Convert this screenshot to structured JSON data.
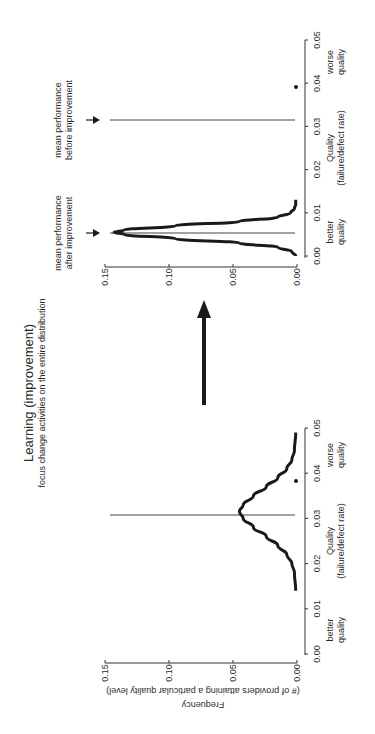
{
  "figure": {
    "title": "Learning (improvement)",
    "subtitle": "focus change activities on the entire distribution",
    "arrow_label": "",
    "colors": {
      "curve": "#1a1a1a",
      "axis": "#333333",
      "mean_line": "#555555",
      "background": "#ffffff"
    }
  },
  "chart_data": [
    {
      "type": "line",
      "name": "before-improvement",
      "title": "",
      "xlabel": "Quality\n(failure/defect rate)",
      "xlabel_line1": "Quality",
      "xlabel_line2": "(failure/defect rate)",
      "ylabel": "Frequency (# of providers attaining a particular quality level)",
      "ylabel_line1": "Frequency",
      "ylabel_line2": "(# of providers attaining a particular quality level)",
      "xlim": [
        0,
        0.05
      ],
      "ylim": [
        0,
        0.15
      ],
      "xticks": [
        "0.00",
        "0.01",
        "0.02",
        "0.03",
        "0.04",
        "0.05"
      ],
      "yticks": [
        "0.00",
        "0.05",
        "0.10",
        "0.15"
      ],
      "x_end_labels": {
        "left": "better\nquality",
        "left_line1": "better",
        "left_line2": "quality",
        "right": "worse\nquality",
        "right_line1": "worse",
        "right_line2": "quality"
      },
      "series": [
        {
          "name": "distribution before improvement",
          "x": [
            0.014,
            0.018,
            0.02,
            0.022,
            0.024,
            0.026,
            0.028,
            0.03,
            0.0315,
            0.033,
            0.035,
            0.037,
            0.039,
            0.041,
            0.043,
            0.045,
            0.049
          ],
          "y": [
            0.001,
            0.002,
            0.004,
            0.008,
            0.015,
            0.024,
            0.034,
            0.042,
            0.045,
            0.042,
            0.034,
            0.024,
            0.015,
            0.008,
            0.004,
            0.002,
            0.001
          ]
        }
      ],
      "mean_line": {
        "x": 0.0315,
        "label": ""
      },
      "outlier_point": {
        "x": 0.039,
        "y": 0.0
      },
      "grid": false
    },
    {
      "type": "line",
      "name": "after-improvement",
      "title": "",
      "xlabel": "Quality\n(failure/defect rate)",
      "xlabel_line1": "Quality",
      "xlabel_line2": "(failure/defect rate)",
      "ylabel": "",
      "xlim": [
        0,
        0.05
      ],
      "ylim": [
        0,
        0.15
      ],
      "xticks": [
        "0.00",
        "0.01",
        "0.02",
        "0.03",
        "0.04",
        "0.05"
      ],
      "yticks": [
        "0.00",
        "0.05",
        "0.10",
        "0.15"
      ],
      "x_end_labels": {
        "left_line1": "better",
        "left_line2": "quality",
        "right_line1": "worse",
        "right_line2": "quality"
      },
      "series": [
        {
          "name": "distribution after improvement",
          "x": [
            0.0,
            0.001,
            0.002,
            0.003,
            0.004,
            0.005,
            0.0055,
            0.006,
            0.007,
            0.008,
            0.009,
            0.01,
            0.011,
            0.012,
            0.013
          ],
          "y": [
            0.001,
            0.004,
            0.015,
            0.045,
            0.095,
            0.135,
            0.143,
            0.135,
            0.095,
            0.045,
            0.015,
            0.005,
            0.002,
            0.001,
            0.001
          ]
        }
      ],
      "mean_lines": [
        {
          "x": 0.0055,
          "label": "mean performance\nafter improvement",
          "label_line1": "mean performance",
          "label_line2": "after improvement"
        },
        {
          "x": 0.0315,
          "label": "mean performance\nbefore improvement",
          "label_line1": "mean performance",
          "label_line2": "before improvement"
        }
      ],
      "outlier_point": {
        "x": 0.039,
        "y": 0.0
      },
      "grid": false
    }
  ]
}
